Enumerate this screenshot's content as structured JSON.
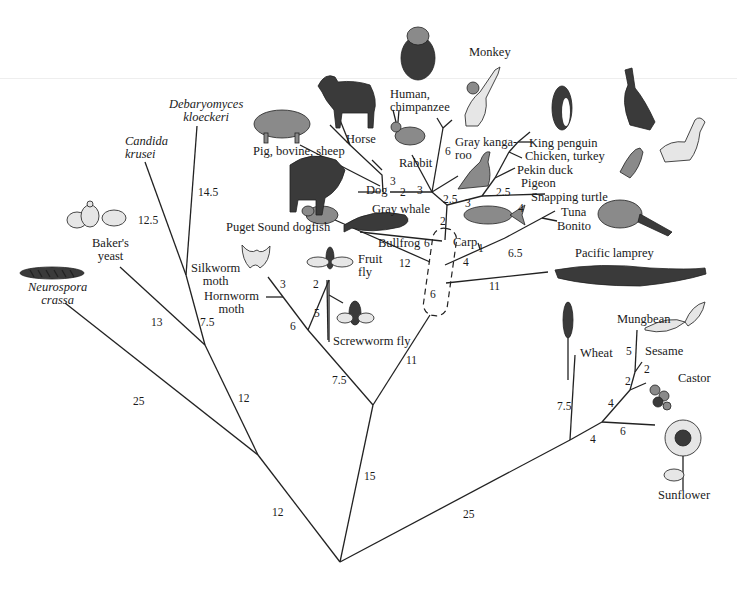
{
  "diagram": {
    "type": "phylogenetic-tree",
    "branch_units": "numbers on branches indicate branch lengths",
    "taxa": [
      {
        "id": "neurospora",
        "label": "Neurospora crassa",
        "lines": [
          "Neurospora",
          "crassa"
        ],
        "italic": true
      },
      {
        "id": "bakers_yeast",
        "label": "Baker's yeast",
        "lines": [
          "Baker's",
          "yeast"
        ],
        "italic": false
      },
      {
        "id": "candida",
        "label": "Candida krusei",
        "lines": [
          "Candida",
          "krusei"
        ],
        "italic": true
      },
      {
        "id": "debaryomyces",
        "label": "Debaryomyces kloeckeri",
        "lines": [
          "Debaryomyces",
          "kloeckeri"
        ],
        "italic": true
      },
      {
        "id": "silkworm",
        "label": "Silkworm moth",
        "lines": [
          "Silkworm",
          "moth"
        ],
        "italic": false
      },
      {
        "id": "hornworm",
        "label": "Hornworm moth",
        "lines": [
          "Hornworm",
          "moth"
        ],
        "italic": false
      },
      {
        "id": "fruit_fly",
        "label": "Fruit fly",
        "lines": [
          "Fruit",
          "fly"
        ],
        "italic": false
      },
      {
        "id": "screwworm",
        "label": "Screwworm fly",
        "lines": [
          "Screwworm fly"
        ],
        "italic": false
      },
      {
        "id": "dogfish",
        "label": "Puget Sound dogfish",
        "lines": [
          "Puget Sound dogfish"
        ],
        "italic": false
      },
      {
        "id": "bullfrog",
        "label": "Bullfrog",
        "lines": [
          "Bullfrog"
        ],
        "italic": false
      },
      {
        "id": "carp",
        "label": "Carp",
        "lines": [
          "Carp"
        ],
        "italic": false
      },
      {
        "id": "gray_whale",
        "label": "Gray whale",
        "lines": [
          "Gray whale"
        ],
        "italic": false
      },
      {
        "id": "dog",
        "label": "Dog",
        "lines": [
          "Dog"
        ],
        "italic": false
      },
      {
        "id": "pig",
        "label": "Pig, bovine, sheep",
        "lines": [
          "Pig, bovine, sheep"
        ],
        "italic": false
      },
      {
        "id": "horse",
        "label": "Horse",
        "lines": [
          "Horse"
        ],
        "italic": false
      },
      {
        "id": "rabbit",
        "label": "Rabbit",
        "lines": [
          "Rabbit"
        ],
        "italic": false
      },
      {
        "id": "human",
        "label": "Human, chimpanzee",
        "lines": [
          "Human,",
          "chimpanzee"
        ],
        "italic": false
      },
      {
        "id": "monkey",
        "label": "Monkey",
        "lines": [
          "Monkey"
        ],
        "italic": false
      },
      {
        "id": "kangaroo",
        "label": "Gray kangaroo",
        "lines": [
          "Gray kanga-",
          "roo"
        ],
        "italic": false
      },
      {
        "id": "king_penguin",
        "label": "King penguin",
        "lines": [
          "King penguin"
        ],
        "italic": false
      },
      {
        "id": "chicken",
        "label": "Chicken, turkey",
        "lines": [
          "Chicken, turkey"
        ],
        "italic": false
      },
      {
        "id": "pekin_duck",
        "label": "Pekin duck",
        "lines": [
          "Pekin duck"
        ],
        "italic": false
      },
      {
        "id": "pigeon",
        "label": "Pigeon",
        "lines": [
          "Pigeon"
        ],
        "italic": false
      },
      {
        "id": "snapping_turtle",
        "label": "Snapping turtle",
        "lines": [
          "Snapping turtle"
        ],
        "italic": false
      },
      {
        "id": "tuna",
        "label": "Tuna",
        "lines": [
          "Tuna"
        ],
        "italic": false
      },
      {
        "id": "bonito",
        "label": "Bonito",
        "lines": [
          "Bonito"
        ],
        "italic": false
      },
      {
        "id": "lamprey",
        "label": "Pacific lamprey",
        "lines": [
          "Pacific lamprey"
        ],
        "italic": false
      },
      {
        "id": "wheat",
        "label": "Wheat",
        "lines": [
          "Wheat"
        ],
        "italic": false
      },
      {
        "id": "mungbean",
        "label": "Mungbean",
        "lines": [
          "Mungbean"
        ],
        "italic": false
      },
      {
        "id": "sesame",
        "label": "Sesame",
        "lines": [
          "Sesame"
        ],
        "italic": false
      },
      {
        "id": "castor",
        "label": "Castor",
        "lines": [
          "Castor"
        ],
        "italic": false
      },
      {
        "id": "sunflower",
        "label": "Sunflower",
        "lines": [
          "Sunflower"
        ],
        "italic": false
      }
    ],
    "branch_labels": [
      {
        "id": "root_fungi",
        "value": "12"
      },
      {
        "id": "root_animals",
        "value": "15"
      },
      {
        "id": "root_plants",
        "value": "25"
      },
      {
        "id": "neurospora",
        "value": "25"
      },
      {
        "id": "fungi_inner",
        "value": "12"
      },
      {
        "id": "bakers_yeast",
        "value": "13"
      },
      {
        "id": "yeast_pair",
        "value": "7.5"
      },
      {
        "id": "candida",
        "value": "12.5"
      },
      {
        "id": "debaryomyces",
        "value": "14.5"
      },
      {
        "id": "insects",
        "value": "7.5"
      },
      {
        "id": "moths",
        "value": "6"
      },
      {
        "id": "silkworm",
        "value": "3"
      },
      {
        "id": "flies",
        "value": "5"
      },
      {
        "id": "fruit_fly",
        "value": "2"
      },
      {
        "id": "vertebrates",
        "value": "11"
      },
      {
        "id": "lamprey",
        "value": "11"
      },
      {
        "id": "dashed_box",
        "value": "6"
      },
      {
        "id": "dogfish",
        "value": "12"
      },
      {
        "id": "bullfrog",
        "value": "6"
      },
      {
        "id": "fish_stem",
        "value": "4"
      },
      {
        "id": "carp",
        "value": "1"
      },
      {
        "id": "tuna_bonito",
        "value": "6.5"
      },
      {
        "id": "tetrapods",
        "value": "2"
      },
      {
        "id": "reptile_bird",
        "value": "3"
      },
      {
        "id": "snapping_turtle",
        "value": "4"
      },
      {
        "id": "birds",
        "value": "2.5"
      },
      {
        "id": "mammals",
        "value": "2.5"
      },
      {
        "id": "kangaroo",
        "value": "6"
      },
      {
        "id": "rabbit",
        "value": "3"
      },
      {
        "id": "ungulates",
        "value": "2"
      },
      {
        "id": "horse",
        "value": "3"
      },
      {
        "id": "wheat",
        "value": "7.5"
      },
      {
        "id": "dicots",
        "value": "4"
      },
      {
        "id": "sunflower",
        "value": "6"
      },
      {
        "id": "rosids",
        "value": "4"
      },
      {
        "id": "castor_node",
        "value": "2"
      },
      {
        "id": "castor",
        "value": "2"
      },
      {
        "id": "mungbean",
        "value": "5"
      }
    ]
  }
}
